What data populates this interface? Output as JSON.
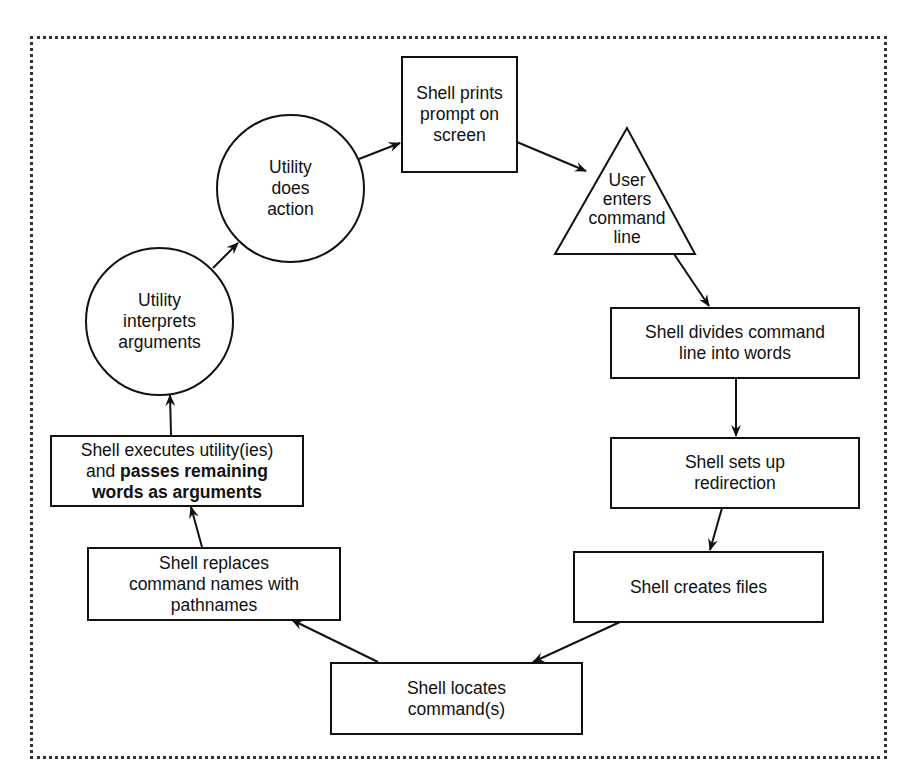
{
  "diagram": {
    "nodes": {
      "prompt": {
        "shape": "rectangle",
        "lines": [
          "Shell prints",
          "prompt on",
          "screen"
        ]
      },
      "user_enters": {
        "shape": "triangle",
        "lines": [
          "User",
          "enters",
          "command",
          "line"
        ]
      },
      "divides": {
        "shape": "rectangle",
        "lines": [
          "Shell divides command",
          "line into words"
        ]
      },
      "redirection": {
        "shape": "rectangle",
        "lines": [
          "Shell sets up",
          "redirection"
        ]
      },
      "creates_files": {
        "shape": "rectangle",
        "lines": [
          "Shell creates files"
        ]
      },
      "locates": {
        "shape": "rectangle",
        "lines": [
          "Shell locates",
          "command(s)"
        ]
      },
      "replaces": {
        "shape": "rectangle",
        "lines": [
          "Shell replaces",
          "command names with",
          "pathnames"
        ]
      },
      "executes": {
        "shape": "rectangle",
        "line1": "Shell executes utility(ies)",
        "line2_normal": "and ",
        "line2_bold": "passes remaining",
        "line3_bold": "words as arguments"
      },
      "interprets": {
        "shape": "circle",
        "lines": [
          "Utility",
          "interprets",
          "arguments"
        ]
      },
      "does_action": {
        "shape": "circle",
        "lines": [
          "Utility",
          "does",
          "action"
        ]
      }
    },
    "edges": [
      {
        "from": "prompt",
        "to": "user_enters"
      },
      {
        "from": "user_enters",
        "to": "divides"
      },
      {
        "from": "divides",
        "to": "redirection"
      },
      {
        "from": "redirection",
        "to": "creates_files"
      },
      {
        "from": "creates_files",
        "to": "locates"
      },
      {
        "from": "locates",
        "to": "replaces"
      },
      {
        "from": "replaces",
        "to": "executes"
      },
      {
        "from": "executes",
        "to": "interprets"
      },
      {
        "from": "interprets",
        "to": "does_action"
      },
      {
        "from": "does_action",
        "to": "prompt"
      }
    ],
    "colors": {
      "stroke": "#111111",
      "background": "#ffffff",
      "frame": "#333333"
    }
  }
}
